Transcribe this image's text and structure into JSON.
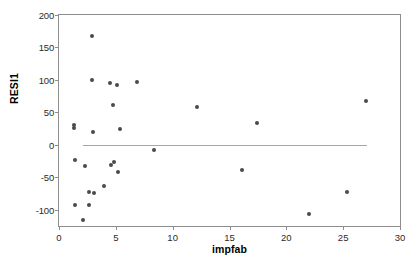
{
  "chart_data": {
    "type": "scatter",
    "title": "",
    "xlabel": "impfab",
    "ylabel": "RESI1",
    "xlim": [
      0,
      30
    ],
    "ylim": [
      -125,
      200
    ],
    "xticks": [
      0,
      5,
      10,
      15,
      20,
      25,
      30
    ],
    "yticks": [
      200,
      150,
      100,
      50,
      0,
      -50,
      -100
    ],
    "grid": false,
    "legend": null,
    "point_color": "#4a4a4a",
    "frame_color": "#8d8d8d",
    "reference_line": {
      "y": 0,
      "x_start": 2.1,
      "x_end": 27.1,
      "color": "#a6a6a6"
    },
    "points": [
      {
        "x": 1.35,
        "y": 30
      },
      {
        "x": 1.35,
        "y": 26
      },
      {
        "x": 1.4,
        "y": -23
      },
      {
        "x": 1.4,
        "y": -92
      },
      {
        "x": 2.1,
        "y": -116
      },
      {
        "x": 2.25,
        "y": -33
      },
      {
        "x": 2.6,
        "y": -72
      },
      {
        "x": 2.65,
        "y": -93
      },
      {
        "x": 2.9,
        "y": 168
      },
      {
        "x": 2.9,
        "y": 100
      },
      {
        "x": 2.95,
        "y": 20
      },
      {
        "x": 3.05,
        "y": -74
      },
      {
        "x": 4.0,
        "y": -63
      },
      {
        "x": 4.45,
        "y": 96
      },
      {
        "x": 4.6,
        "y": -31
      },
      {
        "x": 4.75,
        "y": 62
      },
      {
        "x": 4.85,
        "y": -26
      },
      {
        "x": 5.1,
        "y": 92
      },
      {
        "x": 5.2,
        "y": -42
      },
      {
        "x": 5.4,
        "y": 24
      },
      {
        "x": 6.9,
        "y": 97
      },
      {
        "x": 8.35,
        "y": -8
      },
      {
        "x": 12.1,
        "y": 59
      },
      {
        "x": 16.1,
        "y": -39
      },
      {
        "x": 17.4,
        "y": 33
      },
      {
        "x": 22.0,
        "y": -106
      },
      {
        "x": 25.3,
        "y": -72
      },
      {
        "x": 27.0,
        "y": 67
      }
    ]
  }
}
